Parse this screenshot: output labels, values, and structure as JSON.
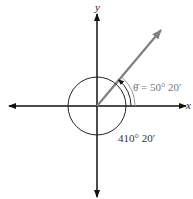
{
  "diagram": {
    "axes": {
      "x_label": "x",
      "y_label": "y"
    },
    "reference_angle_label": "θ̄ = 50° 20′",
    "angle_label": "410° 20′",
    "angle_degrees": 410.333,
    "reference_angle_degrees": 50.333,
    "colors": {
      "axes": "#111111",
      "ray": "#808080",
      "reference_arc": "#999999",
      "circle": "#222222"
    }
  }
}
